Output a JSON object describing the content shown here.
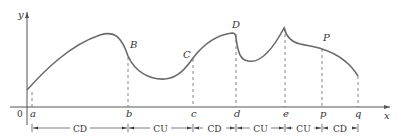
{
  "diagram": {
    "axes": {
      "x_label": "x",
      "y_label": "y",
      "origin_label": "0"
    },
    "x_ticks": [
      {
        "label": "a",
        "x": 32
      },
      {
        "label": "b",
        "x": 128
      },
      {
        "label": "c",
        "x": 193
      },
      {
        "label": "d",
        "x": 236
      },
      {
        "label": "e",
        "x": 285
      },
      {
        "label": "p",
        "x": 322
      },
      {
        "label": "q",
        "x": 358
      }
    ],
    "points": [
      {
        "label": "B",
        "x": 128,
        "y": 56
      },
      {
        "label": "C",
        "x": 193,
        "y": 58
      },
      {
        "label": "D",
        "x": 236,
        "y": 34
      },
      {
        "label": "P",
        "x": 322,
        "y": 49
      }
    ],
    "intervals": [
      {
        "label": "CD",
        "from": "a",
        "to": "b"
      },
      {
        "label": "CU",
        "from": "b",
        "to": "c"
      },
      {
        "label": "CD",
        "from": "c",
        "to": "d"
      },
      {
        "label": "CU",
        "from": "d",
        "to": "e"
      },
      {
        "label": "CU",
        "from": "e",
        "to": "p"
      },
      {
        "label": "CD",
        "from": "p",
        "to": "q"
      }
    ],
    "colors": {
      "curve": "#6a6a6a",
      "axis": "#555555",
      "text": "#333333"
    }
  }
}
